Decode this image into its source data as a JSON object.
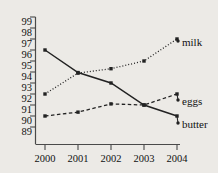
{
  "chart_data": {
    "type": "line",
    "title": "",
    "subtitle": "",
    "xlabel": "",
    "ylabel": "",
    "categories": [
      "2000",
      "2001",
      "2002",
      "2003",
      "2004"
    ],
    "x": [
      2000,
      2001,
      2002,
      2003,
      2004
    ],
    "xlim": [
      2000,
      2004
    ],
    "ylim": [
      89,
      99
    ],
    "yticks": [
      89,
      90,
      91,
      92,
      93,
      94,
      95,
      96,
      97,
      98,
      99
    ],
    "ytick_labels": [
      "89",
      "90",
      "91",
      "92",
      "93",
      "94",
      "95",
      "96",
      "97",
      "98",
      "99"
    ],
    "grid": false,
    "legend_position": "right-inline",
    "marker": "filled-square",
    "series": [
      {
        "name": "milk",
        "label": "milk",
        "linestyle": "dotted",
        "color": "#222222",
        "values": [
          92.0,
          93.9,
          94.3,
          95.0,
          97.0
        ]
      },
      {
        "name": "eggs",
        "label": "eggs",
        "linestyle": "dashed",
        "color": "#222222",
        "values": [
          90.0,
          90.35,
          91.1,
          91.0,
          92.0
        ]
      },
      {
        "name": "butter",
        "label": "butter",
        "linestyle": "solid",
        "color": "#222222",
        "values": [
          96.0,
          93.95,
          93.0,
          91.0,
          90.0
        ]
      }
    ]
  },
  "axis": {
    "y_labels": [
      "99",
      "98",
      "97",
      "96",
      "95",
      "94",
      "93",
      "92",
      "91",
      "90",
      "89"
    ],
    "x_labels": [
      "2000",
      "2001",
      "2002",
      "2003",
      "2004"
    ]
  },
  "labels": {
    "milk": "milk",
    "eggs": "eggs",
    "butter": "butter"
  },
  "colors": {
    "background": "#eceae6",
    "ink": "#222222",
    "axis": "#4a4a4a"
  }
}
